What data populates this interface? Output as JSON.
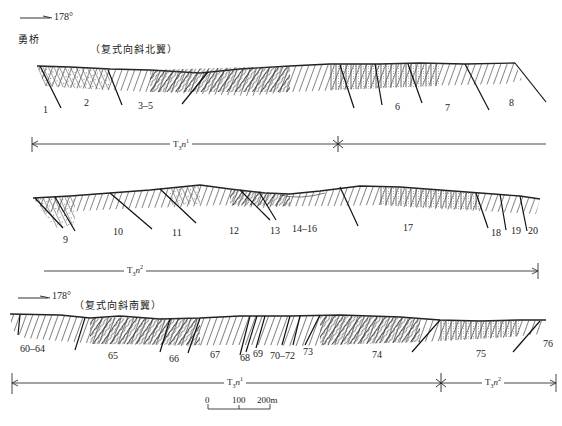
{
  "diagram": {
    "type": "geological-cross-section",
    "sections": [
      {
        "id": "section-1",
        "direction_label": "178°",
        "location": "勇桥",
        "subtitle": "（复式向斜北翼）",
        "bed_labels": [
          "1",
          "2",
          "3–5",
          "6",
          "7",
          "8"
        ],
        "unit_bar": [
          {
            "unit": "T",
            "sub": "3",
            "italic": "n",
            "sup": "1"
          }
        ]
      },
      {
        "id": "section-2",
        "bed_labels": [
          "9",
          "10",
          "11",
          "12",
          "13",
          "14–16",
          "17",
          "18",
          "19",
          "20"
        ],
        "unit_bar": [
          {
            "unit": "T",
            "sub": "3",
            "italic": "n",
            "sup": "2"
          }
        ]
      },
      {
        "id": "section-3",
        "direction_label": "178°",
        "subtitle": "（复式向斜南翼）",
        "bed_labels": [
          "60–64",
          "65",
          "66",
          "67",
          "68",
          "69",
          "70–72",
          "73",
          "74",
          "75",
          "76"
        ],
        "unit_bar": [
          {
            "unit": "T",
            "sub": "3",
            "italic": "n",
            "sup": "1"
          },
          {
            "unit": "T",
            "sub": "3",
            "italic": "n",
            "sup": "2"
          }
        ]
      }
    ],
    "scale_bar": {
      "ticks": [
        "0",
        "100",
        "200m"
      ]
    }
  }
}
